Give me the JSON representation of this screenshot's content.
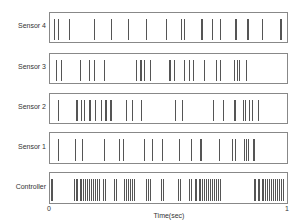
{
  "chart_data": {
    "type": "raster",
    "title": "",
    "xlabel": "Time(sec)",
    "ylabel": "",
    "xlim": [
      0,
      1
    ],
    "xticks": [
      "0",
      "1"
    ],
    "grid": false,
    "legend": "none",
    "rows": [
      {
        "name": "Sensor 4",
        "spikes": [
          0.017,
          0.033,
          0.079,
          0.188,
          0.259,
          0.331,
          0.41,
          0.494,
          0.556,
          0.569,
          0.644,
          0.648,
          0.69,
          0.724,
          0.787,
          0.791,
          0.837,
          0.841,
          0.9,
          0.979,
          0.985
        ]
      },
      {
        "name": "Sensor 3",
        "spikes": [
          0.025,
          0.046,
          0.128,
          0.165,
          0.188,
          0.23,
          0.364,
          0.381,
          0.389,
          0.398,
          0.402,
          0.427,
          0.506,
          0.51,
          0.527,
          0.569,
          0.59,
          0.607,
          0.657,
          0.707,
          0.724,
          0.781,
          0.795,
          0.803,
          0.833
        ]
      },
      {
        "name": "Sensor 2",
        "spikes": [
          0.033,
          0.109,
          0.113,
          0.13,
          0.146,
          0.167,
          0.172,
          0.192,
          0.218,
          0.234,
          0.238,
          0.255,
          0.259,
          0.322,
          0.347,
          0.388,
          0.531,
          0.561,
          0.695,
          0.736,
          0.782,
          0.787,
          0.82,
          0.828,
          0.845,
          0.858,
          0.883,
          0.887
        ]
      },
      {
        "name": "Sensor 1",
        "spikes": [
          0.033,
          0.105,
          0.138,
          0.23,
          0.293,
          0.31,
          0.402,
          0.435,
          0.477,
          0.548,
          0.602,
          0.64,
          0.644,
          0.72,
          0.774,
          0.787,
          0.824,
          0.833,
          0.841,
          0.862,
          0.87
        ]
      },
      {
        "name": "Controller",
        "spikes": [
          0.004,
          0.008,
          0.1,
          0.109,
          0.117,
          0.126,
          0.134,
          0.142,
          0.151,
          0.159,
          0.167,
          0.176,
          0.184,
          0.192,
          0.201,
          0.209,
          0.226,
          0.234,
          0.272,
          0.28,
          0.314,
          0.322,
          0.331,
          0.339,
          0.347,
          0.356,
          0.41,
          0.418,
          0.427,
          0.473,
          0.481,
          0.544,
          0.552,
          0.59,
          0.598,
          0.615,
          0.623,
          0.632,
          0.64,
          0.648,
          0.657,
          0.665,
          0.674,
          0.682,
          0.69,
          0.699,
          0.707,
          0.715,
          0.724,
          0.866,
          0.874,
          0.883,
          0.891,
          0.9,
          0.908,
          0.916,
          0.925,
          0.933,
          0.941,
          0.95,
          0.958,
          0.967,
          0.975,
          0.983,
          0.992
        ]
      }
    ]
  },
  "labels": {
    "row0": "Sensor 4",
    "row1": "Sensor 3",
    "row2": "Sensor 2",
    "row3": "Sensor 1",
    "row4": "Controller",
    "x_start": "0",
    "x_end": "1",
    "xlabel": "Time(sec)"
  },
  "colors": {
    "spike": "#555555",
    "frame": "#888888"
  }
}
